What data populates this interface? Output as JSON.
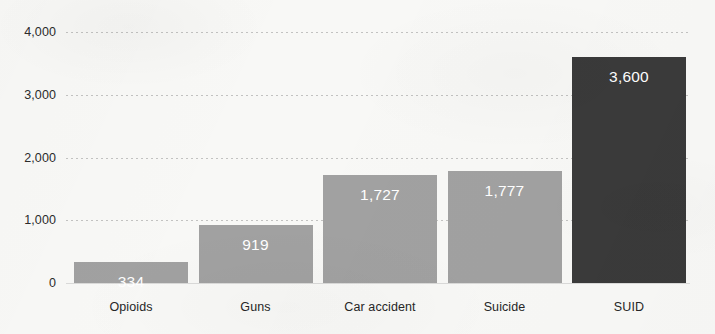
{
  "chart_data": {
    "type": "bar",
    "title": "",
    "subtitle": "",
    "xlabel": "",
    "ylabel": "",
    "categories": [
      "Opioids",
      "Guns",
      "Car accident",
      "Suicide",
      "SUID"
    ],
    "values": [
      334,
      919,
      1727,
      1777,
      3600
    ],
    "value_labels": [
      "334",
      "919",
      "1,727",
      "1,777",
      "3,600"
    ],
    "bar_colors": [
      "#a1a1a1",
      "#a1a1a1",
      "#a1a1a1",
      "#a1a1a1",
      "#3a3a3a"
    ],
    "value_label_color": "#ffffff",
    "ylim": [
      0,
      4000
    ],
    "yticks": [
      0,
      1000,
      2000,
      3000,
      4000
    ],
    "ytick_labels": [
      "0",
      "1,000",
      "2,000",
      "3,000",
      "4,000"
    ],
    "grid": true,
    "grid_style": "dotted-horizontal",
    "grid_color": "#787878",
    "legend": null,
    "legend_position": "none",
    "background_color": "#f8f8f6",
    "annotations": []
  }
}
